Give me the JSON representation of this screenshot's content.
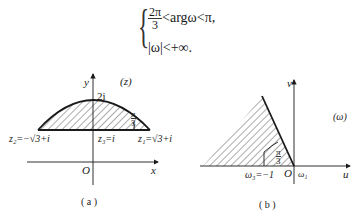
{
  "formula": {
    "line1": {
      "frac_num": "2π",
      "frac_den": "3",
      "rest": "<argω<π,"
    },
    "line2": "|ω|<+∞."
  },
  "figure_a": {
    "plane_label": "(z)",
    "axis_x": "x",
    "axis_y": "y",
    "origin": "O",
    "top_point": "2i",
    "z2_label": "z₂=−√3+i",
    "z3_label": "z₃=i",
    "z1_label": "z₁=√3+i",
    "angle_num": "π",
    "angle_den": "3",
    "caption": "( a )"
  },
  "figure_b": {
    "plane_label": "(ω)",
    "axis_u": "u",
    "axis_v": "v",
    "origin": "O",
    "w1_label": "ω₁",
    "w3_label": "ω₃=−1",
    "angle_num": "π",
    "angle_den": "3",
    "caption": "( b )"
  },
  "colors": {
    "line": "#1a1a1a",
    "hatch": "#444444",
    "background": "#ffffff"
  }
}
